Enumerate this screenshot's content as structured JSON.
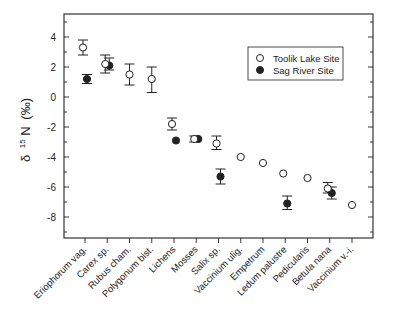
{
  "chart_data": {
    "type": "scatter",
    "title": "",
    "xlabel": "",
    "ylabel": "δ 15N (‰)",
    "ylabel_parts": {
      "delta": "δ",
      "sup": "15",
      "element": "N",
      "unit": "(‰)"
    },
    "ylim": [
      -9.5,
      5.5
    ],
    "yticks": [
      4,
      2,
      0,
      -2,
      -4,
      -6,
      -8
    ],
    "ytick_labels": [
      "4",
      "2",
      "0",
      "-2",
      "-4",
      "-6",
      "-8"
    ],
    "grid": false,
    "legend_position": "upper right",
    "categories": [
      "Eriophorum vag.",
      "Carex sp.",
      "Rubus cham.",
      "Polygonum bist.",
      "Lichens",
      "Mosses",
      "Salix sp.",
      "Vaccinium ulig.",
      "Empetrum",
      "Ledum palustre",
      "Pedicularis",
      "Betula nana",
      "Vaccinium v.-i."
    ],
    "series": [
      {
        "name": "Toolik Lake Site",
        "marker": "open-circle",
        "values": [
          3.3,
          2.2,
          1.5,
          1.2,
          -1.8,
          -2.8,
          -3.1,
          -4.0,
          -4.4,
          -5.1,
          -5.4,
          -6.1,
          -7.2
        ],
        "err_low": [
          2.8,
          1.6,
          0.8,
          0.3,
          -2.2,
          -3.0,
          -3.5,
          -4.0,
          -4.5,
          -5.2,
          -5.4,
          -6.4,
          -7.3
        ],
        "err_high": [
          3.8,
          2.8,
          2.2,
          2.0,
          -1.4,
          -2.6,
          -2.6,
          -4.0,
          -4.3,
          -5.0,
          -5.4,
          -5.7,
          -7.1
        ]
      },
      {
        "name": "Sag River Site",
        "marker": "filled-circle",
        "values": [
          1.2,
          2.1,
          null,
          null,
          -2.9,
          -2.8,
          -5.3,
          null,
          null,
          -7.1,
          null,
          -6.4,
          null
        ],
        "err_low": [
          0.9,
          1.8,
          null,
          null,
          -2.9,
          -2.8,
          -5.8,
          null,
          null,
          -7.5,
          null,
          -6.8,
          null
        ],
        "err_high": [
          1.5,
          2.6,
          null,
          null,
          -2.9,
          -2.8,
          -4.8,
          null,
          null,
          -6.6,
          null,
          -6.0,
          null
        ]
      }
    ]
  },
  "legend": {
    "items": [
      {
        "label": "Toolik Lake Site",
        "marker": "open-circle"
      },
      {
        "label": "Sag River Site",
        "marker": "filled-circle"
      }
    ]
  },
  "colors": {
    "ink": "#222222",
    "background": "#ffffff"
  }
}
